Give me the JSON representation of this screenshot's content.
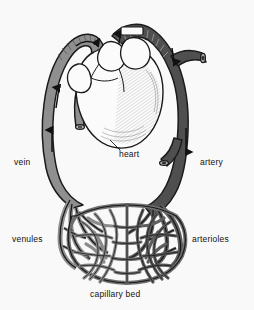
{
  "figure": {
    "background_color": "#f9f9f9",
    "labels": {
      "vein": "vein",
      "artery": "artery",
      "heart": "heart",
      "venules": "venules",
      "arterioles": "arterioles",
      "capillary_bed": "capillary bed"
    },
    "colors": {
      "vein_fill": "#8f8f8f",
      "artery_fill": "#4f4f4f",
      "capillary_fill": "#6f6f6f",
      "outline": "#1a1a1a",
      "heart_fill": "#fbfbfb",
      "heart_shading": "#5a5a5a",
      "label_text": "#111111"
    },
    "flow_arrows": [
      {
        "name": "vein-lower-arrow",
        "direction": "up",
        "vessel": "vein"
      },
      {
        "name": "vein-upper-arrow",
        "direction": "up",
        "vessel": "vein"
      },
      {
        "name": "vein-arch-arrow",
        "direction": "right",
        "vessel": "vein"
      },
      {
        "name": "artery-arch-arrow",
        "direction": "up",
        "vessel": "artery"
      },
      {
        "name": "artery-branch-arrow",
        "direction": "down",
        "vessel": "artery"
      },
      {
        "name": "artery-lower-arrow",
        "direction": "down",
        "vessel": "artery"
      }
    ]
  }
}
